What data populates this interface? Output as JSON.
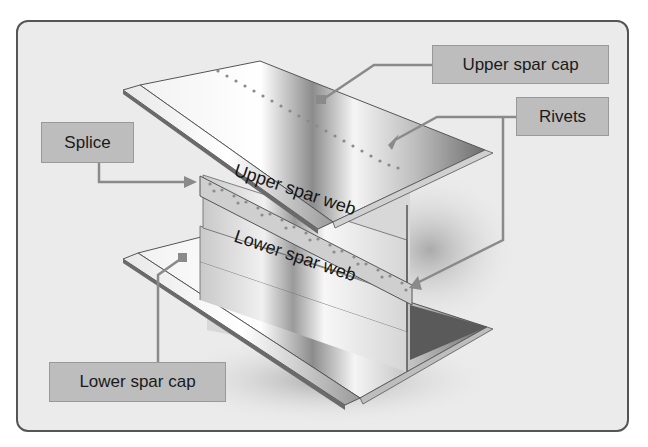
{
  "diagram": {
    "labels": {
      "upper_spar_cap": "Upper spar cap",
      "rivets": "Rivets",
      "splice": "Splice",
      "lower_spar_cap": "Lower spar cap",
      "upper_spar_web": "Upper spar web",
      "lower_spar_web": "Lower spar web"
    },
    "colors": {
      "frame_bg": "#ebebeb",
      "frame_border": "#555555",
      "label_bg": "#bdbdbd",
      "leader_line": "#8a8a8a",
      "metal_light": "#f4f4f4",
      "metal_dark": "#7a7a7a"
    }
  }
}
